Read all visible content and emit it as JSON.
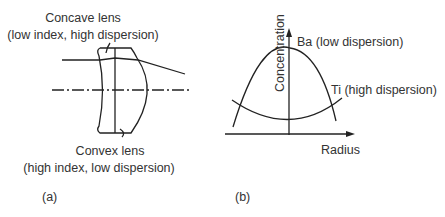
{
  "panel_a": {
    "label": "(a)",
    "concave_lens": {
      "name": "Concave lens",
      "detail": "(low index, high dispersion)"
    },
    "convex_lens": {
      "name": "Convex lens",
      "detail": "(high index, low dispersion)"
    }
  },
  "panel_b": {
    "label": "(b)",
    "y_axis_label": "Concentration",
    "x_axis_label": "Radius",
    "curves": [
      {
        "name": "Ba (low dispersion)",
        "shape": "downward parabola, max at center"
      },
      {
        "name": "Ti (high dispersion)",
        "shape": "upward parabola, min at center"
      }
    ]
  },
  "colors": {
    "line": "#222222",
    "text": "#333333",
    "background": "#ffffff"
  }
}
